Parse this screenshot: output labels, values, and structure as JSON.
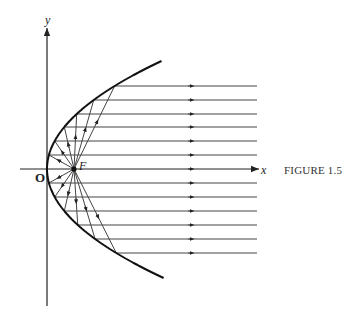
{
  "figure": {
    "caption": "FIGURE 1.5",
    "labels": {
      "y_axis": "y",
      "x_axis": "x",
      "origin": "O",
      "focus": "F"
    }
  },
  "geometry": {
    "vertex": [
      47,
      169
    ],
    "focus": [
      74,
      169
    ],
    "ray_levels_above": [
      86,
      100,
      114,
      127,
      141,
      155
    ],
    "ray_levels_below": [
      183,
      197,
      211,
      225,
      239,
      253
    ],
    "ray_end_x": 257,
    "curve_y_range": [
      61,
      278
    ]
  },
  "colors": {
    "ink": "#222222",
    "ray": "#444444"
  }
}
